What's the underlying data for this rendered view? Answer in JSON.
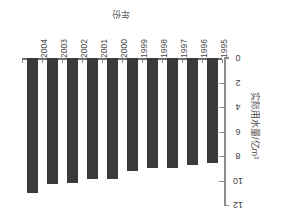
{
  "chart_data": {
    "type": "bar",
    "title": "",
    "xlabel": "年份",
    "ylabel": "实际用水量/亿m³",
    "categories": [
      "2004",
      "2003",
      "2002",
      "2001",
      "2000",
      "1999",
      "1998",
      "1997",
      "1996",
      "1995"
    ],
    "values": [
      11.0,
      10.3,
      10.2,
      9.9,
      9.9,
      9.2,
      9.0,
      9.0,
      8.7,
      8.6
    ],
    "series": [
      {
        "name": "实际用水量",
        "values": [
          11.0,
          10.3,
          10.2,
          9.9,
          9.9,
          9.2,
          9.0,
          9.0,
          8.7,
          8.6
        ]
      }
    ],
    "ylim": [
      0,
      12
    ],
    "y_inverted": true,
    "y_ticks": [
      0,
      2,
      4,
      6,
      8,
      10,
      12
    ],
    "y_tick_labels": [
      "0",
      "2",
      "4",
      "6",
      "8",
      "10",
      "12"
    ],
    "grid": false,
    "legend": false,
    "legend_position": "none",
    "bar_color": "#3a3a3a",
    "axis_color": "#8d8d8d",
    "rotation_note": "chart rendered rotated 180 degrees",
    "orientation": "bars hang downward from top baseline; value axis on right side"
  }
}
